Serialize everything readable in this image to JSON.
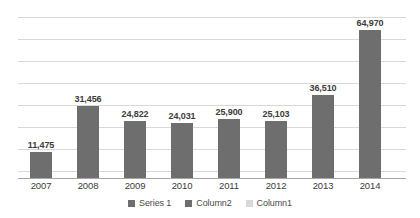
{
  "chart_data": {
    "type": "bar",
    "title": "",
    "subtitle": "",
    "xlabel": "",
    "ylabel": "",
    "categories": [
      "2007",
      "2008",
      "2009",
      "2010",
      "2011",
      "2012",
      "2013",
      "2014"
    ],
    "values": [
      11475,
      31456,
      24822,
      24031,
      25900,
      25103,
      36510,
      64970
    ],
    "data_labels": [
      "11,475",
      "31,456",
      "24,822",
      "24,031",
      "25,900",
      "25,103",
      "36,510",
      "64,970"
    ],
    "series": [
      {
        "name": "Series 1",
        "values": [
          11475,
          31456,
          24822,
          24031,
          25900,
          25103,
          36510,
          64970
        ],
        "color": "#6e6e6e"
      }
    ],
    "ylim": [
      0,
      72000
    ],
    "ytick_labels": [],
    "grid": true,
    "gridline_count": 8,
    "grid_color": "#d8d8d8",
    "axis_color": "#a6a6a6",
    "legend_position": "bottom",
    "legend": [
      {
        "label": "Series 1",
        "color": "#6e6e6e"
      },
      {
        "label": "Column2",
        "color": "#6e6e6e"
      },
      {
        "label": "Column1",
        "color": "#d9d9d9"
      }
    ]
  },
  "colors": {
    "background": "#ffffff",
    "bar": "#6e6e6e",
    "grid": "#d8d8d8",
    "axis": "#a6a6a6",
    "label_text": "#3b3b3b",
    "legend_text": "#4a4a4a"
  }
}
